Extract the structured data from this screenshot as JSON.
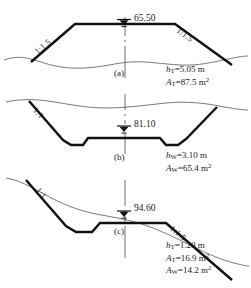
{
  "figure": {
    "type": "engineering-cross-sections",
    "panels": [
      {
        "id": "(a)",
        "kind": "fill-embankment",
        "elevation": "65.50",
        "elevation_symbol": "water-level-triangle-icon",
        "slopes": [
          {
            "side": "left",
            "text": "1:1.5"
          },
          {
            "side": "right",
            "text": "1:1.5"
          }
        ],
        "annotations": [
          {
            "symbol": "h",
            "subscript": "T",
            "value": "=5.05 m",
            "superscript": ""
          },
          {
            "symbol": "A",
            "subscript": "T",
            "value": "=87.5 m",
            "superscript": "2"
          }
        ]
      },
      {
        "id": "(b)",
        "kind": "cut-excavation",
        "elevation": "81.10",
        "elevation_symbol": "water-level-triangle-icon",
        "slopes": [
          {
            "side": "left",
            "text": "1:1"
          }
        ],
        "annotations": [
          {
            "symbol": "h",
            "subscript": "W",
            "value": "=3.10 m",
            "superscript": ""
          },
          {
            "symbol": "A",
            "subscript": "W",
            "value": "=65.4 m",
            "superscript": "2"
          }
        ]
      },
      {
        "id": "(c)",
        "kind": "side-hill-cut-and-fill",
        "elevation": "94.60",
        "elevation_symbol": "water-level-triangle-icon",
        "slopes": [
          {
            "side": "left",
            "text": "1:1"
          },
          {
            "side": "right",
            "text": "1:1.5"
          }
        ],
        "annotations": [
          {
            "symbol": "h",
            "subscript": "T",
            "value": "=1.20 m",
            "superscript": ""
          },
          {
            "symbol": "A",
            "subscript": "T",
            "value": "=16.9 m",
            "superscript": "2"
          },
          {
            "symbol": "A",
            "subscript": "W",
            "value": "=14.2 m",
            "superscript": "2"
          }
        ]
      }
    ],
    "colors": {
      "template_line": "#111111",
      "ground_line": "#6a6a6a",
      "centerline": "#4a4a4a",
      "text": "#1a1a1a",
      "background": "#ffffff"
    }
  }
}
